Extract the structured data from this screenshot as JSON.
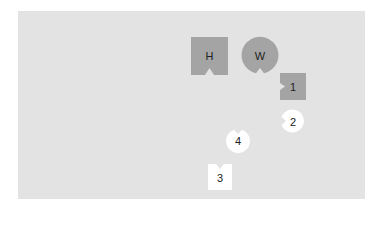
{
  "diagram": {
    "background_color": "#e3e3e3",
    "shape_dark_color": "#a4a4a4",
    "shape_light_color": "#ffffff",
    "pieces": [
      {
        "id": "H",
        "label": "H",
        "shape": "square",
        "fill": "dark",
        "notch": "bottom"
      },
      {
        "id": "W",
        "label": "W",
        "shape": "circle",
        "fill": "dark",
        "notch": "bottom"
      },
      {
        "id": "1",
        "label": "1",
        "shape": "square",
        "fill": "dark",
        "notch": "left"
      },
      {
        "id": "2",
        "label": "2",
        "shape": "circle",
        "fill": "light",
        "notch": "left"
      },
      {
        "id": "4",
        "label": "4",
        "shape": "circle",
        "fill": "light",
        "notch": "top"
      },
      {
        "id": "3",
        "label": "3",
        "shape": "square",
        "fill": "light",
        "notch": "top"
      }
    ]
  }
}
